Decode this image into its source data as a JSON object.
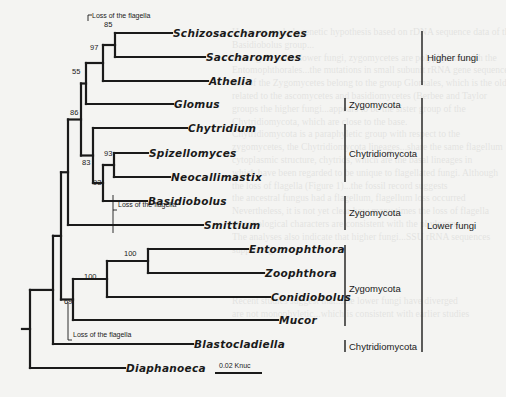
{
  "figure": {
    "type": "phylogenetic-tree",
    "leaves": [
      {
        "name": "Schizosaccharomyces",
        "y": 33,
        "x_end": 172
      },
      {
        "name": "Saccharomyces",
        "y": 57,
        "x_end": 205
      },
      {
        "name": "Athelia",
        "y": 81,
        "x_end": 208
      },
      {
        "name": "Glomus",
        "y": 104,
        "x_end": 173
      },
      {
        "name": "Chytridium",
        "y": 128,
        "x_end": 187
      },
      {
        "name": "Spizellomyces",
        "y": 153,
        "x_end": 148
      },
      {
        "name": "Neocallimastix",
        "y": 177,
        "x_end": 170
      },
      {
        "name": "Basidiobolus",
        "y": 201,
        "x_end": 147
      },
      {
        "name": "Smittium",
        "y": 225,
        "x_end": 203
      },
      {
        "name": "Entomophthora",
        "y": 249,
        "x_end": 248
      },
      {
        "name": "Zoophthora",
        "y": 273,
        "x_end": 264
      },
      {
        "name": "Conidiobolus",
        "y": 297,
        "x_end": 270
      },
      {
        "name": "Mucor",
        "y": 320,
        "x_end": 278
      },
      {
        "name": "Blastocladiella",
        "y": 344,
        "x_end": 193
      },
      {
        "name": "Diaphanoeca",
        "y": 368,
        "x_end": 125
      }
    ],
    "bootstrap": [
      {
        "value": "85",
        "x": 104,
        "y": 20
      },
      {
        "value": "97",
        "x": 90,
        "y": 43
      },
      {
        "value": "55",
        "x": 72,
        "y": 67
      },
      {
        "value": "86",
        "x": 70,
        "y": 108
      },
      {
        "value": "83",
        "x": 82,
        "y": 158
      },
      {
        "value": "93",
        "x": 104,
        "y": 149
      },
      {
        "value": "93",
        "x": 93,
        "y": 178
      },
      {
        "value": "100",
        "x": 124,
        "y": 249
      },
      {
        "value": "100",
        "x": 84,
        "y": 272
      },
      {
        "value": "69",
        "x": 64,
        "y": 297
      }
    ],
    "annotations": [
      {
        "text": "Loss of the flagella",
        "x": 92,
        "y": 17
      },
      {
        "text": "Loss of the flagella",
        "x": 118,
        "y": 206
      },
      {
        "text": "Loss of the flagella",
        "x": 73,
        "y": 336
      }
    ],
    "groups": [
      {
        "label": "Higher fungi",
        "x": 427,
        "y": 57,
        "bar_x": 422,
        "y1": 31,
        "y2": 85
      },
      {
        "label": "Zygomycota",
        "x": 349,
        "y": 104,
        "bar_x": 345,
        "y1": 98,
        "y2": 111
      },
      {
        "label": "Chytridiomycota",
        "x": 349,
        "y": 153,
        "bar_x": 345,
        "y1": 124,
        "y2": 182
      },
      {
        "label": "Zygomycota",
        "x": 349,
        "y": 212,
        "bar_x": 345,
        "y1": 196,
        "y2": 230
      },
      {
        "label": "Zygomycota",
        "x": 349,
        "y": 288,
        "bar_x": 345,
        "y1": 245,
        "y2": 326
      },
      {
        "label": "Chytridiomycota",
        "x": 349,
        "y": 346,
        "bar_x": 345,
        "y1": 340,
        "y2": 352
      },
      {
        "label": "Lower fungi",
        "x": 427,
        "y": 225,
        "bar_x": 422,
        "y1": 98,
        "y2": 352
      }
    ],
    "scale_bar": {
      "label": "0.02 Knuc",
      "x1": 215,
      "x2": 262,
      "y": 373
    }
  },
  "bleed_text": [
    "However, a phylogenetic hypothesis based on rDNA sequence data of the",
    "Basidiobolus group...",
    "Among the other lower fungi, zygomycetes are polyphyletic with the",
    "Entomophthorales...the mutations in small subunit rRNA gene sequences in",
    "one of the Zygomycetes belong to the group Glomales, which is the oldest",
    "related to the ascomycetes and basidiomycetes (Berbee and Taylor",
    "groups the higher fungi...appears to be the sister group of the",
    "Chytridiomycota, which are close to the base.",
    "Chytridiomycota is a paraphyletic group with respect to the",
    "zygomycetes, the Chytridiomycota lineages...share the same flagellum",
    "cytoplasmic structure, chytrids, which are the basal lineages in",
    "which have been regarded to be unique to flagellated fungi. Although",
    "the loss of flagella (Figure 1)...the fossil record suggests",
    "the ancestral fungus had a flagellum, flagellum loss occurred",
    "Nevertheless, it is not yet clear how many times the loss of flagella",
    "morphological characters are consistent with the phylogeny",
    "The analyses also indicate that higher fungi...SSU rRNA sequences",
    "supporting...",
    "",
    "",
    "",
    "Recent studies suggest that...the lower fungi have diverged",
    "are not monophyletic...which is consistent with earlier studies"
  ]
}
